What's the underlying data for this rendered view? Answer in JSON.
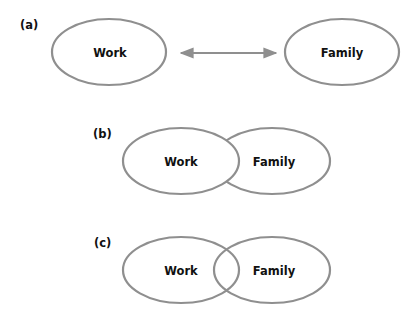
{
  "diagram": {
    "stroke_color": "#8f8f8f",
    "text_color": "#111111",
    "panels": [
      {
        "id": "a",
        "label": "(a)",
        "relation": "separate-with-bidirectional-arrow",
        "nodes": [
          {
            "label": "Work",
            "cx": 109,
            "cy": 52,
            "rx": 57,
            "ry": 33
          },
          {
            "label": "Family",
            "cx": 342,
            "cy": 52,
            "rx": 57,
            "ry": 33
          }
        ],
        "arrow": {
          "x1": 180,
          "x2": 276,
          "y": 53,
          "direction": "both"
        }
      },
      {
        "id": "b",
        "label": "(b)",
        "relation": "overlap-work-in-front",
        "nodes": [
          {
            "label": "Work",
            "cx": 181,
            "cy": 161,
            "rx": 58,
            "ry": 33
          },
          {
            "label": "Family",
            "cx": 272,
            "cy": 161,
            "rx": 58,
            "ry": 33
          }
        ]
      },
      {
        "id": "c",
        "label": "(c)",
        "relation": "overlap-intersecting",
        "nodes": [
          {
            "label": "Work",
            "cx": 181,
            "cy": 270,
            "rx": 58,
            "ry": 33
          },
          {
            "label": "Family",
            "cx": 272,
            "cy": 270,
            "rx": 58,
            "ry": 33
          }
        ]
      }
    ]
  }
}
